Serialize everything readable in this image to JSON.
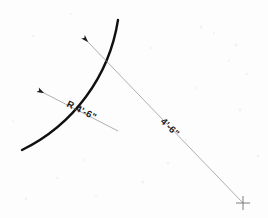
{
  "drawing": {
    "title": "Arc radius dimension detail",
    "background_color": "#fdfdfd",
    "arc": {
      "name": "curved-wall-arc",
      "color": "#111111",
      "stroke_width": 2.4,
      "start_x": 118,
      "start_y": 20,
      "end_x": 22,
      "end_y": 150,
      "sweep_note": "convex toward upper-right"
    },
    "radius_dimension": {
      "label": "R 4'-6\"",
      "line_color": "#8d8d8d",
      "stroke_width": 0.7,
      "arrow_x": 44,
      "arrow_y": 93,
      "tail_x": 118,
      "tail_y": 131,
      "text_x": 66,
      "text_y": 106,
      "text_rotation": 27
    },
    "radius_leader": {
      "label": "4'-6\"",
      "line_color": "#8d8d8d",
      "stroke_width": 0.7,
      "arrow_x": 88,
      "arrow_y": 42,
      "center_x": 243,
      "center_y": 203,
      "text_x": 160,
      "text_y": 122,
      "text_rotation": 44
    },
    "center_mark": {
      "label": "center-point",
      "x": 243,
      "y": 203,
      "arm_length": 7,
      "color": "#6f6f6f",
      "stroke_width": 0.9
    }
  }
}
